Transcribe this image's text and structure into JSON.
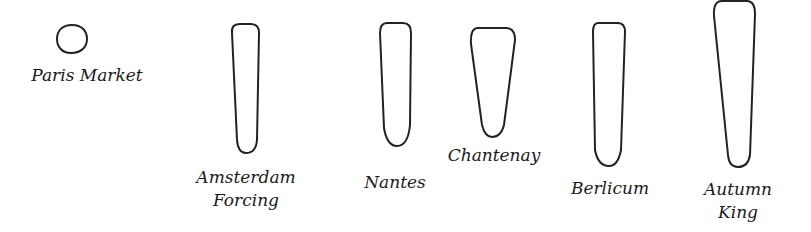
{
  "stroke_color": "#222222",
  "background": "#ffffff",
  "varieties": [
    {
      "name": "Paris Market",
      "label_lines": [
        "Paris Market"
      ],
      "shape": "round"
    },
    {
      "name": "Amsterdam Forcing",
      "label_lines": [
        "Amsterdam",
        "Forcing"
      ],
      "shape": "slender cylindrical, slightly tapered"
    },
    {
      "name": "Nantes",
      "label_lines": [
        "Nantes"
      ],
      "shape": "cylindrical, blunt"
    },
    {
      "name": "Chantenay",
      "label_lines": [
        "Chantenay"
      ],
      "shape": "short conical, broad shoulders"
    },
    {
      "name": "Berlicum",
      "label_lines": [
        "Berlicum"
      ],
      "shape": "long cylindrical"
    },
    {
      "name": "Autumn King",
      "label_lines": [
        "Autumn",
        "King"
      ],
      "shape": "long conical, broad shoulders"
    }
  ]
}
